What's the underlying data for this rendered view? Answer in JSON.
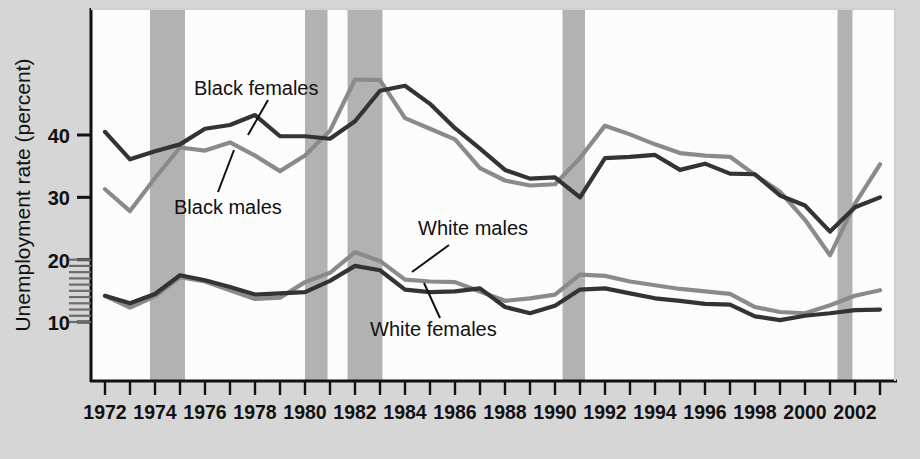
{
  "chart_data": {
    "type": "line",
    "title": "",
    "subtitle": "",
    "xlabel": "",
    "ylabel": "Unemployment rate (percent)",
    "xlim": [
      1972,
      2003
    ],
    "ylim": [
      0,
      50
    ],
    "yticks": [
      10,
      20,
      30,
      40
    ],
    "ytick_labels": [
      "10",
      "20",
      "30",
      "40"
    ],
    "y_minor_ticks_between": "10-20",
    "grid": false,
    "legend_position": "inline-annotations",
    "x": [
      1972,
      1973,
      1974,
      1975,
      1976,
      1977,
      1978,
      1979,
      1980,
      1981,
      1982,
      1983,
      1984,
      1985,
      1986,
      1987,
      1988,
      1989,
      1990,
      1991,
      1992,
      1993,
      1994,
      1995,
      1996,
      1997,
      1998,
      1999,
      2000,
      2001,
      2002,
      2003
    ],
    "xticks": [
      1972,
      1973,
      1974,
      1975,
      1976,
      1977,
      1978,
      1979,
      1980,
      1981,
      1982,
      1983,
      1984,
      1985,
      1986,
      1987,
      1988,
      1989,
      1990,
      1991,
      1992,
      1993,
      1994,
      1995,
      1996,
      1997,
      1998,
      1999,
      2000,
      2001,
      2002,
      2003
    ],
    "xtick_labels": [
      "1972",
      "",
      "1974",
      "",
      "1976",
      "",
      "1978",
      "",
      "1980",
      "",
      "1982",
      "",
      "1984",
      "",
      "1986",
      "",
      "1988",
      "",
      "1990",
      "",
      "1992",
      "",
      "1994",
      "",
      "1996",
      "",
      "1998",
      "",
      "2000",
      "",
      "2002",
      ""
    ],
    "series": [
      {
        "name": "Black females",
        "color": "#333333",
        "label_text": "Black females",
        "values": [
          40.5,
          36.1,
          37.4,
          38.5,
          41.0,
          41.6,
          43.2,
          39.8,
          39.8,
          39.4,
          42.2,
          47.1,
          47.9,
          45.0,
          41.1,
          37.8,
          34.4,
          33.0,
          33.2,
          30.0,
          36.3,
          36.5,
          36.8,
          34.4,
          35.4,
          33.8,
          33.7,
          30.3,
          28.7,
          24.5,
          28.4,
          30.0
        ]
      },
      {
        "name": "Black males",
        "color": "#8a8a8a",
        "label_text": "Black males",
        "values": [
          31.3,
          27.8,
          33.1,
          38.0,
          37.5,
          38.8,
          36.7,
          34.2,
          36.7,
          40.7,
          48.9,
          48.8,
          42.7,
          41.0,
          39.3,
          34.7,
          32.7,
          31.9,
          32.1,
          36.3,
          41.5,
          40.1,
          38.5,
          37.1,
          36.7,
          36.5,
          33.6,
          30.9,
          26.4,
          20.7,
          29.0,
          35.3
        ]
      },
      {
        "name": "White males",
        "color": "#8a8a8a",
        "label_text": "White males",
        "values": [
          14.2,
          12.3,
          14.1,
          17.2,
          16.5,
          15.1,
          13.7,
          13.9,
          16.4,
          17.9,
          21.2,
          19.8,
          16.8,
          16.5,
          16.4,
          14.9,
          13.4,
          13.8,
          14.4,
          17.6,
          17.4,
          16.5,
          15.9,
          15.3,
          14.9,
          14.5,
          12.4,
          11.6,
          11.4,
          12.7,
          14.2,
          15.1
        ]
      },
      {
        "name": "White females",
        "color": "#333333",
        "label_text": "White females",
        "values": [
          14.2,
          13.0,
          14.5,
          17.5,
          16.7,
          15.6,
          14.4,
          14.6,
          14.8,
          16.6,
          19.0,
          18.3,
          15.2,
          14.8,
          14.9,
          15.4,
          12.4,
          11.4,
          12.6,
          15.2,
          15.4,
          14.6,
          13.8,
          13.4,
          12.9,
          12.8,
          10.9,
          10.3,
          11.0,
          11.4,
          11.9,
          12.0
        ]
      }
    ],
    "recession_bands": [
      {
        "start": 1973.8,
        "end": 1975.2
      },
      {
        "start": 1980.0,
        "end": 1980.9
      },
      {
        "start": 1981.7,
        "end": 1983.1
      },
      {
        "start": 1990.3,
        "end": 1991.2
      },
      {
        "start": 2001.3,
        "end": 2001.9
      }
    ],
    "recession_band_color": "#b2b2b2",
    "plot_background": "#fcfcfc",
    "figure_background": "#d6d6d6",
    "annotations": [
      {
        "text": "Black females",
        "x": 210,
        "y": 93
      },
      {
        "text": "Black males",
        "x": 175,
        "y": 211
      },
      {
        "text": "White males",
        "x": 420,
        "y": 235
      },
      {
        "text": "White females",
        "x": 372,
        "y": 334
      }
    ]
  }
}
